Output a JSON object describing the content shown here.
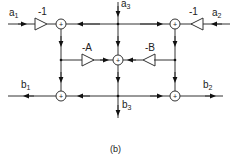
{
  "diagram": {
    "inputs": {
      "a1": "a",
      "a1_sub": "1",
      "a2": "a",
      "a2_sub": "2",
      "a3": "a",
      "a3_sub": "3"
    },
    "outputs": {
      "b1": "b",
      "b1_sub": "1",
      "b2": "b",
      "b2_sub": "2",
      "b3": "b",
      "b3_sub": "3"
    },
    "gains": {
      "left": "-1",
      "right": "-1",
      "A": "-A",
      "B": "-B"
    },
    "adder_symbol": "+",
    "caption": "(b)"
  }
}
